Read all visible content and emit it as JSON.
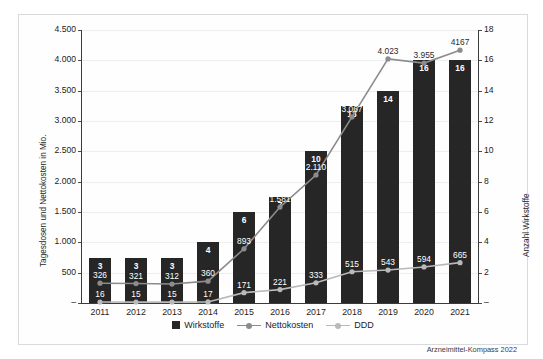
{
  "chart_data": {
    "type": "bar",
    "title": "",
    "categories": [
      "2011",
      "2012",
      "2013",
      "2014",
      "2015",
      "2016",
      "2017",
      "2018",
      "2019",
      "2020",
      "2021"
    ],
    "xlabel": "",
    "ylabel": "Tagesdosen und Nettokosten in Mio.",
    "y2label": "Anzahl Wirkstoffe",
    "ylim": [
      0,
      4500
    ],
    "y2lim": [
      0,
      18
    ],
    "grid": true,
    "legend_position": "bottom-center",
    "yticks": [
      "–",
      "500",
      "1.000",
      "1.500",
      "2.000",
      "2.500",
      "3.000",
      "3.500",
      "4.000",
      "4.500"
    ],
    "ytick_values": [
      0,
      500,
      1000,
      1500,
      2000,
      2500,
      3000,
      3500,
      4000,
      4500
    ],
    "y2ticks": [
      "–",
      "2",
      "4",
      "6",
      "8",
      "10",
      "12",
      "14",
      "16",
      "18"
    ],
    "y2tick_values": [
      0,
      2,
      4,
      6,
      8,
      10,
      12,
      14,
      16,
      18
    ],
    "series": [
      {
        "name": "Wirkstoffe",
        "type": "bar",
        "axis": "right",
        "color": "#262626",
        "values": [
          3,
          3,
          3,
          4,
          6,
          7,
          10,
          13,
          14,
          16,
          16
        ],
        "labels": [
          "3",
          "3",
          "3",
          "4",
          "6",
          "7",
          "10",
          "13",
          "14",
          "16",
          "16"
        ]
      },
      {
        "name": "Nettokosten",
        "type": "line",
        "axis": "left",
        "color": "#8c8c8c",
        "values": [
          326,
          321,
          312,
          360,
          893,
          1581,
          2110,
          3067,
          4023,
          3955,
          4167
        ],
        "labels": [
          "326",
          "321",
          "312",
          "360",
          "893",
          "1.581",
          "2.110",
          "3.067",
          "4.023",
          "3.955",
          "4167"
        ]
      },
      {
        "name": "DDD",
        "type": "line",
        "axis": "left",
        "color": "#b9b9b9",
        "values": [
          16,
          15,
          15,
          17,
          171,
          221,
          333,
          515,
          543,
          594,
          665
        ],
        "labels": [
          "16",
          "15",
          "15",
          "17",
          "171",
          "221",
          "333",
          "515",
          "543",
          "594",
          "665"
        ]
      }
    ]
  },
  "legend": {
    "items": [
      {
        "label": "Wirkstoffe",
        "marker": "square",
        "color": "#262626"
      },
      {
        "label": "Nettokosten",
        "marker": "line-dot",
        "color": "#8c8c8c"
      },
      {
        "label": "DDD",
        "marker": "line-dot",
        "color": "#b9b9b9"
      }
    ]
  },
  "credit": "Arzneimittel-Kompass 2022"
}
